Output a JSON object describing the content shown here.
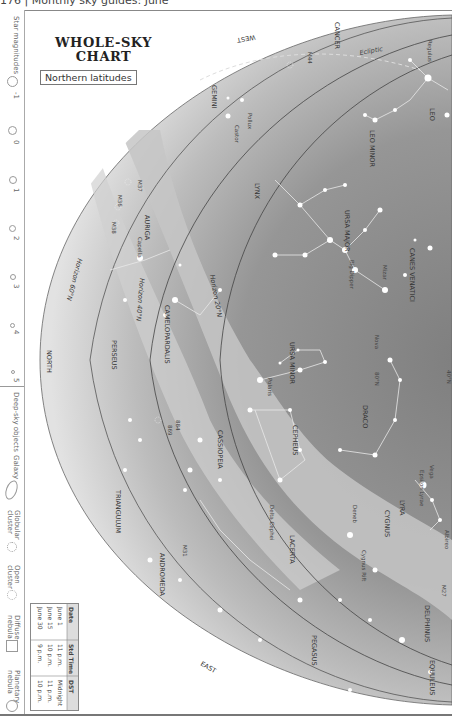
{
  "page_header": "176 | Monthly sky guides: June",
  "title_line1": "WHOLE-SKY",
  "title_line2": "CHART",
  "subtitle": "Northern latitudes",
  "legend": {
    "magnitudes_label": "Star magnitudes",
    "magnitudes": [
      "-1",
      "0",
      "1",
      "2",
      "3",
      "4",
      "5"
    ],
    "deep_sky_label": "Deep-sky objects",
    "deep_sky": [
      "Galaxy",
      "Globular cluster",
      "Open cluster",
      "Diffuse nebula",
      "Planetary nebula"
    ]
  },
  "table": {
    "headers": [
      "Date",
      "Std Time",
      "DST"
    ],
    "rows": [
      [
        "June 1",
        "11 p.m.",
        "Midnight"
      ],
      [
        "June 15",
        "10 p.m.",
        "11 p.m."
      ],
      [
        "June 30",
        "9 p.m.",
        "10 p.m."
      ]
    ]
  },
  "directions": {
    "west": "WEST",
    "north": "NORTH",
    "east": "EAST"
  },
  "horizons": [
    "Horizon 20°N",
    "Horizon 40°N",
    "Horizon 60°N"
  ],
  "ecliptic": "Ecliptic",
  "constellations": [
    "CANCER",
    "GEMINI",
    "LEO",
    "LEO MINOR",
    "LYNX",
    "URSA MAJOR",
    "CANES VENATICI",
    "AURIGA",
    "CAMELOPARDALIS",
    "URSA MINOR",
    "DRACO",
    "CEPHEUS",
    "CASSIOPEIA",
    "PERSEUS",
    "TRIANGULUM",
    "ANDROMEDA",
    "LACERTA",
    "CYGNUS",
    "LYRA",
    "PEGASUS",
    "DELPHINUS",
    "EQUULEUS"
  ],
  "stars": [
    "Regulus",
    "Pollux",
    "Castor",
    "Capella",
    "Mizar",
    "Polaris",
    "Vega",
    "Epsilon Lyrae",
    "Deneb",
    "Albireo",
    "Delta Cephei"
  ],
  "objects": [
    "M44",
    "M37",
    "M36",
    "M38",
    "884",
    "869",
    "M31",
    "M27",
    "Cygnus Rift",
    "Big Dipper"
  ],
  "markers": [
    "Nova",
    "80°N",
    "40°N"
  ],
  "colors": {
    "sky_dark": "#8a8a8a",
    "sky_mid": "#b0b0b0",
    "sky_light": "#d4d4d4",
    "milky_way": "#c8c8c8",
    "frame": "#888888"
  }
}
